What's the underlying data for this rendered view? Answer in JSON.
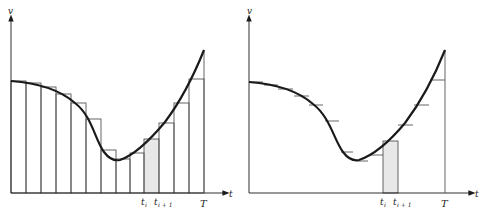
{
  "colors": {
    "ink": "#1a1a1a",
    "thin": "#555555",
    "shade": "#e6e6e6",
    "background": "#ffffff"
  },
  "left_panel": {
    "y_axis_label": "v",
    "x_axis_label": "t",
    "tick_labels": {
      "t_i": "t",
      "t_i_sub": "i",
      "t_i1": "t",
      "t_i1_sub": "i + 1",
      "T": "T"
    },
    "description": "Left Riemann-style step approximation: rectangles under curve v(t), one shaded rectangle between t_i and t_{i+1}"
  },
  "right_panel": {
    "y_axis_label": "v",
    "x_axis_label": "t",
    "tick_labels": {
      "t_i": "t",
      "t_i_sub": "i",
      "t_i1": "t",
      "t_i1_sub": "i + 1",
      "T": "T"
    },
    "description": "Same curve v(t) with short horizontal step tick marks; single shaded rectangle between t_i and t_{i+1}"
  }
}
